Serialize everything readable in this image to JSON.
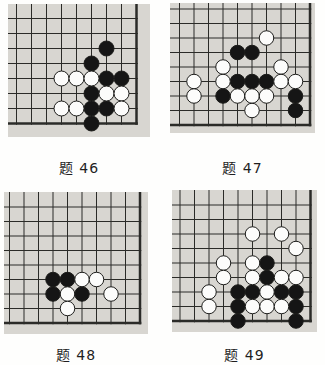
{
  "colors": {
    "page_bg": "#fefefd",
    "board_bg": "#d8d6d1",
    "line": "#2b2b28",
    "stone_black": "#151515",
    "stone_white": "#fcfcfb",
    "stone_border": "#1c1c1a",
    "caption_text": "#1f1f1f"
  },
  "diagrams": [
    {
      "id": "problem-46",
      "caption": "题 46",
      "board": {
        "cols": 9,
        "rows": 8,
        "corner": "bottom-right",
        "edges": [
          "right",
          "bottom"
        ]
      },
      "stones": {
        "black": [
          [
            7,
            3
          ],
          [
            6,
            4
          ],
          [
            7,
            5
          ],
          [
            8,
            5
          ],
          [
            6,
            6
          ],
          [
            6,
            7
          ],
          [
            7,
            7
          ],
          [
            6,
            8
          ]
        ],
        "white": [
          [
            4,
            5
          ],
          [
            5,
            5
          ],
          [
            6,
            5
          ],
          [
            7,
            6
          ],
          [
            8,
            6
          ],
          [
            4,
            7
          ],
          [
            5,
            7
          ],
          [
            8,
            7
          ]
        ]
      }
    },
    {
      "id": "problem-47",
      "caption": "题 47",
      "board": {
        "cols": 10,
        "rows": 9,
        "corner": "bottom-right",
        "edges": [
          "right",
          "bottom"
        ]
      },
      "stones": {
        "black": [
          [
            5,
            4
          ],
          [
            6,
            4
          ],
          [
            5,
            6
          ],
          [
            6,
            6
          ],
          [
            7,
            6
          ],
          [
            4,
            7
          ],
          [
            9,
            7
          ],
          [
            9,
            8
          ]
        ],
        "white": [
          [
            7,
            3
          ],
          [
            4,
            5
          ],
          [
            8,
            5
          ],
          [
            2,
            6
          ],
          [
            4,
            6
          ],
          [
            8,
            6
          ],
          [
            9,
            6
          ],
          [
            2,
            7
          ],
          [
            5,
            7
          ],
          [
            6,
            7
          ],
          [
            7,
            7
          ],
          [
            6,
            8
          ]
        ]
      }
    },
    {
      "id": "problem-48",
      "caption": "题 48",
      "board": {
        "cols": 10,
        "rows": 9,
        "corner": "bottom-right",
        "edges": [
          "right",
          "bottom"
        ]
      },
      "stones": {
        "black": [
          [
            4,
            6
          ],
          [
            5,
            6
          ],
          [
            4,
            7
          ],
          [
            6,
            7
          ]
        ],
        "white": [
          [
            6,
            6
          ],
          [
            7,
            6
          ],
          [
            5,
            7
          ],
          [
            8,
            7
          ],
          [
            5,
            8
          ]
        ]
      }
    },
    {
      "id": "problem-49",
      "caption": "题 49",
      "board": {
        "cols": 10,
        "rows": 9,
        "corner": "bottom-right",
        "edges": [
          "right",
          "bottom"
        ]
      },
      "stones": {
        "black": [
          [
            7,
            5
          ],
          [
            7,
            6
          ],
          [
            5,
            7
          ],
          [
            6,
            7
          ],
          [
            8,
            7
          ],
          [
            9,
            7
          ],
          [
            5,
            8
          ],
          [
            9,
            8
          ],
          [
            5,
            9
          ],
          [
            9,
            9
          ]
        ],
        "white": [
          [
            6,
            3
          ],
          [
            8,
            3
          ],
          [
            9,
            4
          ],
          [
            4,
            5
          ],
          [
            6,
            5
          ],
          [
            4,
            6
          ],
          [
            6,
            6
          ],
          [
            8,
            6
          ],
          [
            9,
            6
          ],
          [
            3,
            7
          ],
          [
            7,
            7
          ],
          [
            3,
            8
          ],
          [
            6,
            8
          ],
          [
            7,
            8
          ],
          [
            8,
            8
          ]
        ]
      }
    }
  ]
}
